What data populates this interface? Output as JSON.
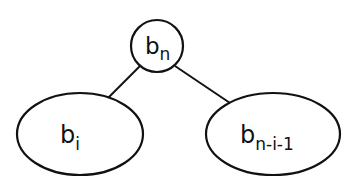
{
  "diagram": {
    "type": "tree",
    "root": {
      "base": "b",
      "sub": "n"
    },
    "left_child": {
      "base": "b",
      "sub": "i"
    },
    "right_child": {
      "base": "b",
      "sub": "n-i-1"
    },
    "colors": {
      "stroke": "#111111",
      "background": "#ffffff"
    }
  }
}
